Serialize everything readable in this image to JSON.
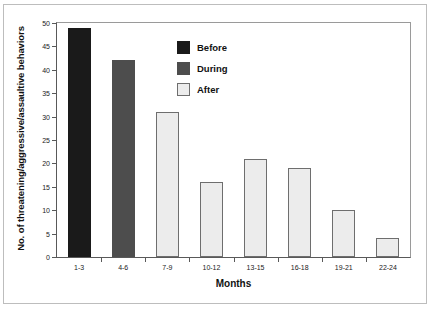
{
  "chart_data": {
    "type": "bar",
    "title": "",
    "xlabel": "Months",
    "ylabel": "No. of threatening/aggressive/assaultive behaviors",
    "categories": [
      "1-3",
      "4-6",
      "7-9",
      "10-12",
      "13-15",
      "16-18",
      "19-21",
      "22-24"
    ],
    "values": [
      49,
      42,
      31,
      16,
      21,
      19,
      10,
      4
    ],
    "series_by_bar": [
      "Before",
      "During",
      "After",
      "After",
      "After",
      "After",
      "After",
      "After"
    ],
    "ylim": [
      0,
      50
    ],
    "yticks": [
      0,
      5,
      10,
      15,
      20,
      25,
      30,
      35,
      40,
      45,
      50
    ],
    "ytick_labels": [
      "0",
      "5",
      "10",
      "15",
      "20",
      "25",
      "30",
      "35",
      "40",
      "45",
      "50"
    ],
    "grid": false,
    "legend_position": "upper-center",
    "legend": [
      {
        "label": "Before",
        "color": "#1a1a1a"
      },
      {
        "label": "During",
        "color": "#4d4d4d"
      },
      {
        "label": "After",
        "color": "#ececec"
      }
    ],
    "colors": {
      "before": "#1a1a1a",
      "during": "#4d4d4d",
      "after": "#ececec",
      "bar_edge": "#6e6e6e",
      "axis": "#595959",
      "text": "#111111"
    }
  }
}
